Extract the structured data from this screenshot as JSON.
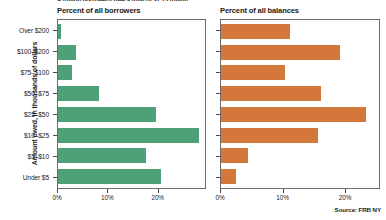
{
  "supertitle": "A trillion borrowers owe a total of $1.73 trillion",
  "y_axis_title": "Amount owed, in thousands of dollars",
  "source": "Source: FRB NY",
  "panels": [
    {
      "title": "Percent of all borrowers"
    },
    {
      "title": "Percent of all balances"
    }
  ],
  "chart_data": [
    {
      "type": "bar",
      "title": "Percent of all borrowers",
      "orientation": "horizontal",
      "color": "#4fa077",
      "categories": [
        "Over $200",
        "$100–$200",
        "$75–$100",
        "$50–$75",
        "$25–$50",
        "$10–$25",
        "$5–$10",
        "Under $5"
      ],
      "values": [
        0.6,
        3.7,
        2.8,
        8.3,
        19.7,
        28.4,
        17.8,
        20.7
      ],
      "xlabel": "",
      "ylabel": "Amount owed, in thousands of dollars",
      "xlim": [
        0,
        29.6
      ],
      "xticks": [
        0,
        10,
        20
      ],
      "xticklabels": [
        "0%",
        "10%",
        "20%"
      ],
      "grid": false,
      "legend": false
    },
    {
      "type": "bar",
      "title": "Percent of all balances",
      "orientation": "horizontal",
      "color": "#d3783a",
      "categories": [
        "Over $200",
        "$100–$200",
        "$75–$100",
        "$50–$75",
        "$25–$50",
        "$10–$25",
        "$5–$10",
        "Under $5"
      ],
      "values": [
        11.2,
        19.3,
        10.4,
        16.2,
        23.5,
        15.7,
        4.3,
        2.4
      ],
      "xlabel": "",
      "ylabel": "Amount owed, in thousands of dollars",
      "xlim": [
        0,
        25.6
      ],
      "xticks": [
        0,
        10,
        20
      ],
      "xticklabels": [
        "0%",
        "10%",
        "20%"
      ],
      "grid": false,
      "legend": false
    }
  ]
}
